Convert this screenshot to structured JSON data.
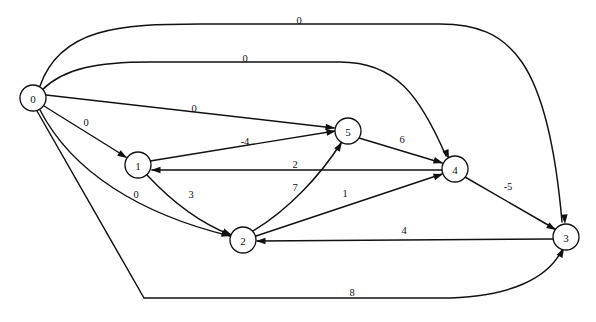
{
  "figure": {
    "background_color": "#ffffff",
    "stroke_color": "#111111",
    "width": 596,
    "height": 322
  },
  "graph_data": {
    "type": "directed-weighted-graph",
    "directed": true,
    "node_radius": 13,
    "nodes": [
      {
        "id": "n0",
        "label": "0",
        "cx": 33,
        "cy": 98,
        "r": 13
      },
      {
        "id": "n1",
        "label": "1",
        "cx": 138,
        "cy": 165,
        "r": 13
      },
      {
        "id": "n2",
        "label": "2",
        "cx": 243,
        "cy": 240,
        "r": 13
      },
      {
        "id": "n3",
        "label": "3",
        "cx": 566,
        "cy": 237,
        "r": 13
      },
      {
        "id": "n4",
        "label": "4",
        "cx": 455,
        "cy": 169,
        "r": 13
      },
      {
        "id": "n5",
        "label": "5",
        "cx": 348,
        "cy": 131,
        "r": 13
      }
    ],
    "edges": [
      {
        "id": "e0-3",
        "from": "0",
        "to": "3",
        "weight": "0",
        "label_x": 299,
        "label_y": 20,
        "path": "M 40 86 C 60 28 120 24 200 24 L 440 24 C 510 24 548 60 562 222",
        "arrow_x": 565,
        "arrow_y": 224,
        "arrow_angle": 86
      },
      {
        "id": "e0-4",
        "from": "0",
        "to": "4",
        "weight": "0",
        "label_x": 245,
        "label_y": 58,
        "path": "M 42 90 C 64 68 98 62 150 62 L 340 62 C 396 62 420 96 446 156",
        "arrow_x": 449,
        "arrow_y": 159,
        "arrow_angle": 68
      },
      {
        "id": "e0-5",
        "from": "0",
        "to": "5",
        "weight": "0",
        "label_x": 194,
        "label_y": 108,
        "path": "M 46 95 L 334 128",
        "arrow_x": 335,
        "arrow_y": 128,
        "arrow_angle": 6.6
      },
      {
        "id": "e0-1",
        "from": "0",
        "to": "1",
        "weight": "0",
        "label_x": 86,
        "label_y": 122,
        "path": "M 44 106 L 126 157",
        "arrow_x": 127,
        "arrow_y": 158,
        "arrow_angle": 31.9
      },
      {
        "id": "e0-2",
        "from": "0",
        "to": "2",
        "weight": "0",
        "label_x": 136,
        "label_y": 194,
        "path": "M 40 110 C 72 172 140 214 230 236",
        "arrow_x": 231,
        "arrow_y": 236,
        "arrow_angle": 15
      },
      {
        "id": "e0-3-lower",
        "from": "0",
        "to": "3",
        "weight": "8",
        "label_x": 352,
        "label_y": 292,
        "path": "M 37 111 L 144 298 L 440 298 C 510 298 548 278 562 250",
        "arrow_x": 564,
        "arrow_y": 248,
        "arrow_angle": -62
      },
      {
        "id": "e1-5",
        "from": "1",
        "to": "5",
        "weight": "-4",
        "label_x": 245,
        "label_y": 141,
        "path": "M 150 161 L 335 131",
        "arrow_x": 336,
        "arrow_y": 131,
        "arrow_angle": -9.2
      },
      {
        "id": "e1-2",
        "from": "1",
        "to": "2",
        "weight": "3",
        "label_x": 191,
        "label_y": 194,
        "path": "M 147 175 C 176 206 202 224 231 235",
        "arrow_x": 232,
        "arrow_y": 235,
        "arrow_angle": 21
      },
      {
        "id": "e2-5",
        "from": "2",
        "to": "5",
        "weight": "7",
        "label_x": 295,
        "label_y": 187,
        "path": "M 253 231 C 288 210 320 176 341 143",
        "arrow_x": 342,
        "arrow_y": 142,
        "arrow_angle": -58
      },
      {
        "id": "e2-4",
        "from": "2",
        "to": "4",
        "weight": "1",
        "label_x": 345,
        "label_y": 193,
        "path": "M 256 236 L 442 174",
        "arrow_x": 443,
        "arrow_y": 174,
        "arrow_angle": -18.4
      },
      {
        "id": "e5-4",
        "from": "5",
        "to": "4",
        "weight": "6",
        "label_x": 402,
        "label_y": 139,
        "path": "M 359 138 L 442 163",
        "arrow_x": 443,
        "arrow_y": 163,
        "arrow_angle": 16.8
      },
      {
        "id": "e4-1",
        "from": "4",
        "to": "1",
        "weight": "2",
        "label_x": 295,
        "label_y": 164,
        "path": "M 442 170 L 152 170",
        "arrow_x": 151,
        "arrow_y": 170,
        "arrow_angle": 180
      },
      {
        "id": "e4-3",
        "from": "4",
        "to": "3",
        "weight": "-5",
        "label_x": 508,
        "label_y": 186,
        "path": "M 465 177 L 555 229",
        "arrow_x": 556,
        "arrow_y": 230,
        "arrow_angle": 30
      },
      {
        "id": "e3-2",
        "from": "3",
        "to": "2",
        "weight": "4",
        "label_x": 404,
        "label_y": 230,
        "path": "M 553 239 L 257 241",
        "arrow_x": 256,
        "arrow_y": 241,
        "arrow_angle": 180
      }
    ]
  }
}
